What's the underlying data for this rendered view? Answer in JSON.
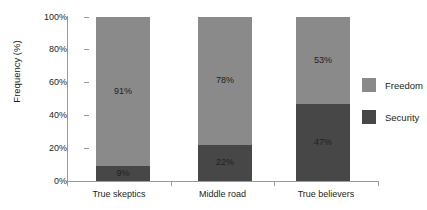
{
  "chart_data": {
    "type": "bar",
    "subtype": "stacked-100-percent",
    "title": "",
    "xlabel": "",
    "ylabel": "Frequency (%)",
    "ylim": [
      0,
      100
    ],
    "yticks": [
      "0%",
      "20%",
      "40%",
      "60%",
      "80%",
      "100%"
    ],
    "ytick_values": [
      0,
      20,
      40,
      60,
      80,
      100
    ],
    "grid": false,
    "legend_position": "right",
    "categories": [
      "True skeptics",
      "Middle road",
      "True believers"
    ],
    "series": [
      {
        "name": "Security",
        "color": "#474747",
        "values": [
          9,
          22,
          47
        ],
        "labels": [
          "9%",
          "22%",
          "47%"
        ]
      },
      {
        "name": "Freedom",
        "color": "#8a8a8a",
        "values": [
          91,
          78,
          53
        ],
        "labels": [
          "91%",
          "78%",
          "53%"
        ]
      }
    ],
    "legend_order": [
      "Freedom",
      "Security"
    ]
  },
  "colors": {
    "freedom": "#8a8a8a",
    "security": "#474747",
    "axis": "#9a9a9a",
    "text": "#231f20",
    "background": "#ffffff"
  }
}
